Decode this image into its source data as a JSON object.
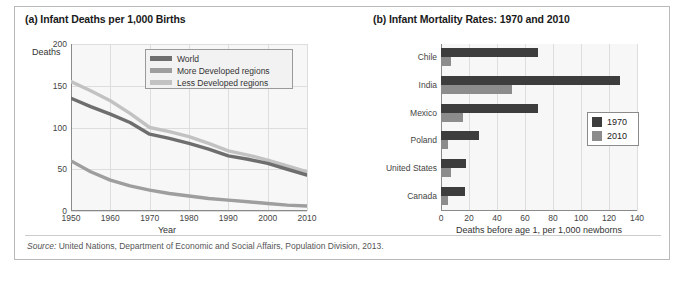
{
  "figure": {
    "source_prefix": "Source:",
    "source_text": " United Nations, Department of Economic and Social Affairs, Population Division, 2013."
  },
  "panel_a": {
    "title": "(a) Infant Deaths per 1,000 Births",
    "y_axis_label": "Deaths",
    "x_axis_label": "Year",
    "legend": [
      {
        "label": "World",
        "color": "#6e6e6e"
      },
      {
        "label": "More Developed regions",
        "color": "#9e9e9e"
      },
      {
        "label": "Less Developed regions",
        "color": "#c2c2c2"
      }
    ]
  },
  "panel_b": {
    "title": "(b) Infant Mortality Rates: 1970 and 2010",
    "x_axis_label": "Deaths before age 1, per 1,000 newborns",
    "legend": [
      {
        "label": "1970",
        "color": "#3d3d3d"
      },
      {
        "label": "2010",
        "color": "#8c8c8c"
      }
    ]
  },
  "chart_data": [
    {
      "type": "line",
      "panel": "a",
      "title": "(a) Infant Deaths per 1,000 Births",
      "xlabel": "Year",
      "ylabel": "Deaths",
      "xlim": [
        1950,
        2010
      ],
      "ylim": [
        0,
        200
      ],
      "xticks": [
        1950,
        1960,
        1970,
        1980,
        1990,
        2000,
        2010
      ],
      "yticks": [
        0,
        50,
        100,
        150,
        200
      ],
      "grid": true,
      "legend_position": "top-right",
      "x": [
        1950,
        1955,
        1960,
        1965,
        1970,
        1975,
        1980,
        1985,
        1990,
        1995,
        2000,
        2005,
        2010
      ],
      "series": [
        {
          "name": "World",
          "color": "#6e6e6e",
          "values": [
            135,
            125,
            116,
            106,
            92,
            87,
            81,
            74,
            66,
            62,
            57,
            50,
            43
          ]
        },
        {
          "name": "More Developed regions",
          "color": "#9e9e9e",
          "values": [
            60,
            47,
            37,
            30,
            25,
            21,
            18,
            15,
            13,
            11,
            9,
            7,
            6
          ]
        },
        {
          "name": "Less Developed regions",
          "color": "#c2c2c2",
          "values": [
            155,
            144,
            132,
            117,
            100,
            95,
            89,
            81,
            72,
            67,
            61,
            54,
            47
          ]
        }
      ]
    },
    {
      "type": "bar",
      "orientation": "horizontal",
      "panel": "b",
      "title": "(b) Infant Mortality Rates: 1970 and 2010",
      "xlabel": "Deaths before age 1, per 1,000 newborns",
      "ylabel": "",
      "xlim": [
        0,
        140
      ],
      "xticks": [
        0,
        20,
        40,
        60,
        80,
        100,
        120,
        140
      ],
      "grid": true,
      "legend_position": "right",
      "categories": [
        "Chile",
        "India",
        "Mexico",
        "Poland",
        "United States",
        "Canada"
      ],
      "series": [
        {
          "name": "1970",
          "color": "#3d3d3d",
          "values": [
            69,
            128,
            69,
            27,
            18,
            17
          ]
        },
        {
          "name": "2010",
          "color": "#8c8c8c",
          "values": [
            7,
            51,
            16,
            5,
            7,
            5
          ]
        }
      ]
    }
  ]
}
